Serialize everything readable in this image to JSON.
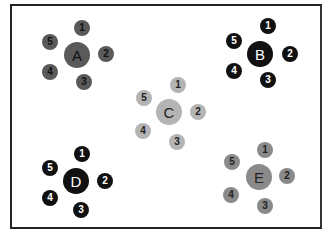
{
  "diagram": {
    "frame": {
      "left": 10,
      "top": 4,
      "width": 312,
      "height": 225
    },
    "clusters": [
      {
        "label": "A",
        "fill": "#5a5a5a",
        "text_color": "#111111",
        "hub": {
          "x": 77,
          "y": 55
        },
        "satellites": [
          {
            "label": "1",
            "x": 82,
            "y": 28
          },
          {
            "label": "2",
            "x": 106,
            "y": 54
          },
          {
            "label": "3",
            "x": 84,
            "y": 82
          },
          {
            "label": "4",
            "x": 50,
            "y": 72
          },
          {
            "label": "5",
            "x": 50,
            "y": 42
          }
        ]
      },
      {
        "label": "B",
        "fill": "#111111",
        "text_color": "#ffffff",
        "hub": {
          "x": 260,
          "y": 54
        },
        "satellites": [
          {
            "label": "1",
            "x": 268,
            "y": 26
          },
          {
            "label": "2",
            "x": 290,
            "y": 54
          },
          {
            "label": "3",
            "x": 268,
            "y": 80
          },
          {
            "label": "4",
            "x": 234,
            "y": 71
          },
          {
            "label": "5",
            "x": 234,
            "y": 41
          }
        ]
      },
      {
        "label": "C",
        "fill": "#b4b4b4",
        "text_color": "#222222",
        "hub": {
          "x": 169,
          "y": 112
        },
        "satellites": [
          {
            "label": "1",
            "x": 178,
            "y": 85
          },
          {
            "label": "2",
            "x": 198,
            "y": 112
          },
          {
            "label": "3",
            "x": 177,
            "y": 142
          },
          {
            "label": "4",
            "x": 143,
            "y": 131
          },
          {
            "label": "5",
            "x": 144,
            "y": 98
          }
        ]
      },
      {
        "label": "D",
        "fill": "#111111",
        "text_color": "#ffffff",
        "hub": {
          "x": 76,
          "y": 181
        },
        "satellites": [
          {
            "label": "1",
            "x": 82,
            "y": 154
          },
          {
            "label": "2",
            "x": 105,
            "y": 181
          },
          {
            "label": "3",
            "x": 81,
            "y": 210
          },
          {
            "label": "4",
            "x": 50,
            "y": 198
          },
          {
            "label": "5",
            "x": 50,
            "y": 168
          }
        ]
      },
      {
        "label": "E",
        "fill": "#8a8a8a",
        "text_color": "#222222",
        "hub": {
          "x": 259,
          "y": 177
        },
        "satellites": [
          {
            "label": "1",
            "x": 265,
            "y": 150
          },
          {
            "label": "2",
            "x": 287,
            "y": 176
          },
          {
            "label": "3",
            "x": 265,
            "y": 206
          },
          {
            "label": "4",
            "x": 231,
            "y": 195
          },
          {
            "label": "5",
            "x": 232,
            "y": 162
          }
        ]
      }
    ]
  }
}
